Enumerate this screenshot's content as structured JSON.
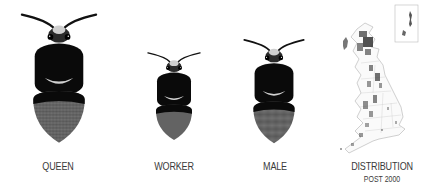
{
  "figures": [
    {
      "id": "queen",
      "label": "QUEEN"
    },
    {
      "id": "worker",
      "label": "WORKER"
    },
    {
      "id": "male",
      "label": "MALE"
    }
  ],
  "distribution": {
    "label": "DISTRIBUTION",
    "sublabel": "POST 2000"
  },
  "colors": {
    "body_black": "#0a0a0a",
    "band_light": "#d8d8d8",
    "abdomen_gray": "#6e6e6e",
    "map_dots": "#333333",
    "map_outline": "#bbbbbb",
    "label_text": "#3a3a3a"
  }
}
